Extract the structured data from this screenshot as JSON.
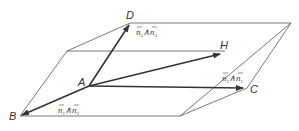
{
  "figure": {
    "type": "geometry-diagram",
    "points": {
      "A": {
        "label": "A",
        "x": 89,
        "y": 86
      },
      "B": {
        "label": "B",
        "x": 20,
        "y": 116
      },
      "C": {
        "label": "C",
        "x": 245,
        "y": 88
      },
      "D": {
        "label": "D",
        "x": 130,
        "y": 23
      },
      "H": {
        "label": "H",
        "x": 222,
        "y": 53
      }
    },
    "vector_labels": {
      "AD": {
        "n_left": "n",
        "sub_left": "2",
        "op": "∧",
        "n_right": "n",
        "sub_right": "3"
      },
      "AC": {
        "n_left": "n",
        "sub_left": "1",
        "op": "∧",
        "n_right": "n",
        "sub_right": "1"
      },
      "AB": {
        "n_left": "n",
        "sub_left": "1",
        "op": "∧",
        "n_right": "n",
        "sub_right": "2"
      }
    },
    "colors": {
      "line": "#555555",
      "vector": "#333333",
      "text": "#333333"
    }
  }
}
